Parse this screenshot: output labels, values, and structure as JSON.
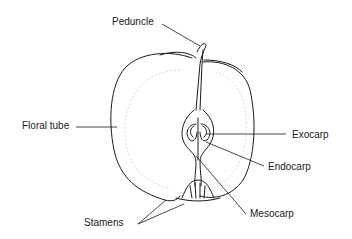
{
  "diagram": {
    "labels": {
      "peduncle": "Peduncle",
      "floral_tube": "Floral tube",
      "exocarp": "Exocarp",
      "endocarp": "Endocarp",
      "mesocarp": "Mesocarp",
      "stamens": "Stamens"
    },
    "colors": {
      "stroke": "#1a1a1a",
      "dotted": "#cfcfcf",
      "background": "#ffffff"
    }
  }
}
